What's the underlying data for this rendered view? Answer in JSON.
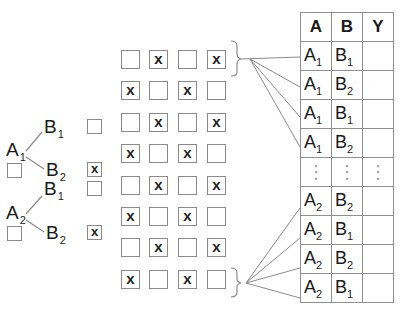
{
  "tree": {
    "branches": [
      {
        "factor": {
          "base": "A",
          "sub": "1"
        },
        "checkbox_checked": false,
        "levels": [
          {
            "base": "B",
            "sub": "1",
            "checked": false
          },
          {
            "base": "B",
            "sub": "2",
            "checked": true
          }
        ]
      },
      {
        "factor": {
          "base": "A",
          "sub": "2"
        },
        "checkbox_checked": false,
        "levels": [
          {
            "base": "B",
            "sub": "1",
            "checked": false
          },
          {
            "base": "B",
            "sub": "2",
            "checked": true
          }
        ]
      }
    ],
    "check_mark": "x"
  },
  "grid": {
    "rows": 8,
    "cols": 4,
    "mark": "x",
    "cells": [
      [
        false,
        true,
        false,
        true
      ],
      [
        true,
        false,
        true,
        false
      ],
      [
        false,
        true,
        false,
        true
      ],
      [
        true,
        false,
        true,
        false
      ],
      [
        false,
        true,
        false,
        true
      ],
      [
        true,
        false,
        true,
        false
      ],
      [
        false,
        true,
        false,
        true
      ],
      [
        true,
        false,
        true,
        false
      ]
    ]
  },
  "table": {
    "headers": [
      "A",
      "B",
      "Y"
    ],
    "rows": [
      {
        "a": {
          "base": "A",
          "sub": "1"
        },
        "b": {
          "base": "B",
          "sub": "1"
        },
        "y": ""
      },
      {
        "a": {
          "base": "A",
          "sub": "1"
        },
        "b": {
          "base": "B",
          "sub": "2"
        },
        "y": ""
      },
      {
        "a": {
          "base": "A",
          "sub": "1"
        },
        "b": {
          "base": "B",
          "sub": "1"
        },
        "y": ""
      },
      {
        "a": {
          "base": "A",
          "sub": "1"
        },
        "b": {
          "base": "B",
          "sub": "2"
        },
        "y": ""
      },
      {
        "ellipsis": true,
        "glyph": "⋮"
      },
      {
        "a": {
          "base": "A",
          "sub": "2"
        },
        "b": {
          "base": "B",
          "sub": "2"
        },
        "y": ""
      },
      {
        "a": {
          "base": "A",
          "sub": "2"
        },
        "b": {
          "base": "B",
          "sub": "1"
        },
        "y": ""
      },
      {
        "a": {
          "base": "A",
          "sub": "2"
        },
        "b": {
          "base": "B",
          "sub": "2"
        },
        "y": ""
      },
      {
        "a": {
          "base": "A",
          "sub": "2"
        },
        "b": {
          "base": "B",
          "sub": "1"
        },
        "y": ""
      }
    ]
  },
  "colors": {
    "line": "#8a8a8a",
    "text": "#1a1a1a",
    "border": "#8f8f8f"
  }
}
